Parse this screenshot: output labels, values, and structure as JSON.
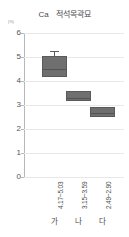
{
  "chart_title": {
    "element": "Ca",
    "korean": "적석목곽묘"
  },
  "unit_label": "(%)",
  "axis": {
    "y_ticks": [
      "6",
      "5",
      "4",
      "3",
      "2",
      "1",
      "0"
    ],
    "y_tick_values": [
      6,
      5,
      4,
      3,
      2,
      1,
      0
    ]
  },
  "chart_data": {
    "type": "bar",
    "title": "Ca 적석목곽묘",
    "xlabel": "",
    "ylabel": "(%)",
    "ylim": [
      0,
      6
    ],
    "grid": true,
    "legend": "none",
    "categories": [
      "가",
      "나",
      "다"
    ],
    "range_labels": [
      "4.17~5.03",
      "3.15~3.59",
      "2.49~2.90"
    ],
    "series": [
      {
        "name": "Ca range",
        "boxes": [
          {
            "category": "가",
            "range_label": "4.17~5.03",
            "low": 4.17,
            "high": 5.03,
            "median": 4.55,
            "whisker_high": 5.25,
            "whisker_low": 5.03
          },
          {
            "category": "나",
            "range_label": "3.15~3.59",
            "low": 3.15,
            "high": 3.59,
            "median": 3.35,
            "whisker_high": null,
            "whisker_low": null
          },
          {
            "category": "다",
            "range_label": "2.49~2.90",
            "low": 2.49,
            "high": 2.9,
            "median": 2.7,
            "whisker_high": null,
            "whisker_low": null
          }
        ]
      }
    ],
    "values": [
      4.6,
      3.37,
      2.7
    ]
  },
  "colors": {
    "box_fill": "#6f6f6f",
    "box_stroke": "#5a5a5a",
    "grid": "#e8e8e8",
    "axis": "#b8b8b8",
    "text": "#4a4a4a"
  }
}
